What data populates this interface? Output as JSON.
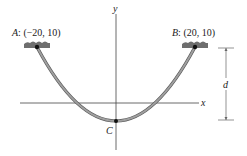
{
  "diagram": {
    "type": "cable-parabola",
    "support_a": {
      "name": "A",
      "coords": "(−20, 10)",
      "label_prefix": "A",
      "label_coords": ": (−20, 10)"
    },
    "support_b": {
      "name": "B",
      "coords": "(20, 10)",
      "label_prefix": "B",
      "label_coords": ": (20, 10)"
    },
    "lowest_point": {
      "label": "C"
    },
    "axes": {
      "x_label": "x",
      "y_label": "y"
    },
    "dimension": {
      "label": "d"
    },
    "colors": {
      "cable": "#8c8c8c",
      "cable_outline": "#5a5a5a",
      "support": "#6e6e6e",
      "axis": "#444444",
      "point": "#111111"
    }
  }
}
